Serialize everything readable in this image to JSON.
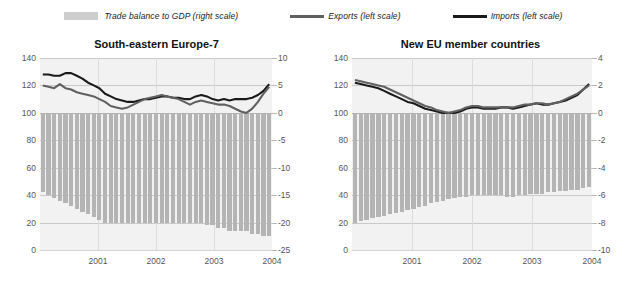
{
  "legend": {
    "items": [
      {
        "label": "Trade balance to GDP (right scale)",
        "marker": "bar-swatch-icon",
        "color": "#cdcdcd"
      },
      {
        "label": "Exports (left scale)",
        "marker": "line-swatch-icon",
        "color": "#606060"
      },
      {
        "label": "Imports (left scale)",
        "marker": "line-swatch-icon",
        "color": "#1a1a1a"
      }
    ]
  },
  "chart_data": [
    {
      "type": "line",
      "panel": "left",
      "title": "South-eastern Europe-7",
      "xlabel": "",
      "ylabel": "",
      "ylim": [
        0,
        140
      ],
      "y2lim": [
        -25,
        10
      ],
      "yticks": [
        0,
        20,
        40,
        60,
        80,
        100,
        120,
        140
      ],
      "y2ticks": [
        -25,
        -20,
        -15,
        -10,
        -5,
        0,
        5,
        10
      ],
      "grid": true,
      "legend_position": "top-center",
      "categories": [
        "2001",
        "2002",
        "2003",
        "2004"
      ],
      "xtick_labels": [
        "2001",
        "2002",
        "2003",
        "2004"
      ],
      "x": [
        0,
        1,
        2,
        3,
        4,
        5,
        6,
        7,
        8,
        9,
        10,
        11,
        12,
        13,
        14,
        15,
        16,
        17,
        18,
        19,
        20,
        21,
        22,
        23,
        24,
        25,
        26,
        27,
        28,
        29,
        30,
        31,
        32,
        33,
        34,
        35,
        36,
        37,
        38,
        39,
        40
      ],
      "series": [
        {
          "name": "Imports (left scale)",
          "axis": "left",
          "color": "#1a1a1a",
          "values": [
            128,
            128,
            127,
            127,
            129,
            129,
            127,
            125,
            122,
            120,
            118,
            114,
            112,
            110,
            109,
            108,
            108,
            109,
            110,
            110,
            111,
            112,
            112,
            111,
            111,
            110,
            110,
            112,
            113,
            112,
            110,
            109,
            110,
            109,
            110,
            110,
            110,
            111,
            113,
            116,
            121
          ]
        },
        {
          "name": "Exports (left scale)",
          "axis": "left",
          "color": "#606060",
          "values": [
            120,
            119,
            118,
            121,
            118,
            117,
            115,
            114,
            113,
            112,
            110,
            108,
            105,
            104,
            103,
            104,
            106,
            108,
            110,
            111,
            112,
            113,
            112,
            111,
            110,
            108,
            106,
            108,
            109,
            108,
            107,
            106,
            106,
            105,
            103,
            101,
            100,
            103,
            108,
            114,
            119
          ]
        },
        {
          "name": "Trade balance to GDP (right scale)",
          "axis": "right",
          "type": "bar",
          "color": "#b4b4b4",
          "values": [
            -14.5,
            -15.0,
            -15.5,
            -16.0,
            -16.5,
            -17.0,
            -17.5,
            -18.0,
            -18.5,
            -19.0,
            -19.5,
            -20.0,
            -20.0,
            -20.0,
            -20.0,
            -20.0,
            -20.0,
            -20.0,
            -20.0,
            -20.0,
            -20.0,
            -20.0,
            -20.0,
            -20.0,
            -20.0,
            -20.0,
            -20.0,
            -20.0,
            -20.0,
            -20.5,
            -20.5,
            -21.0,
            -21.0,
            -21.5,
            -21.5,
            -21.5,
            -21.5,
            -22.0,
            -22.0,
            -22.5,
            -22.5
          ]
        }
      ]
    },
    {
      "type": "line",
      "panel": "right",
      "title": "New EU member countries",
      "xlabel": "",
      "ylabel": "",
      "ylim": [
        0,
        140
      ],
      "y2lim": [
        -10,
        4
      ],
      "yticks": [
        0,
        20,
        40,
        60,
        80,
        100,
        120,
        140
      ],
      "y2ticks": [
        -10,
        -8,
        -6,
        -4,
        -2,
        0,
        2,
        4
      ],
      "grid": true,
      "legend_position": "top-center",
      "categories": [
        "2001",
        "2002",
        "2003",
        "2004"
      ],
      "xtick_labels": [
        "2001",
        "2002",
        "2003",
        "2004"
      ],
      "x": [
        0,
        1,
        2,
        3,
        4,
        5,
        6,
        7,
        8,
        9,
        10,
        11,
        12,
        13,
        14,
        15,
        16,
        17,
        18,
        19,
        20,
        21,
        22,
        23,
        24,
        25,
        26,
        27,
        28,
        29,
        30,
        31,
        32,
        33,
        34,
        35,
        36,
        37,
        38,
        39,
        40
      ],
      "series": [
        {
          "name": "Imports (left scale)",
          "axis": "left",
          "color": "#1a1a1a",
          "values": [
            122,
            121,
            120,
            119,
            118,
            116,
            114,
            112,
            110,
            108,
            107,
            105,
            103,
            102,
            101,
            100,
            100,
            100,
            101,
            103,
            104,
            104,
            103,
            103,
            103,
            104,
            104,
            103,
            104,
            105,
            106,
            107,
            106,
            106,
            107,
            108,
            109,
            111,
            113,
            117,
            121
          ]
        },
        {
          "name": "Exports (left scale)",
          "axis": "left",
          "color": "#606060",
          "values": [
            124,
            123,
            122,
            121,
            120,
            119,
            117,
            115,
            113,
            111,
            109,
            107,
            105,
            104,
            102,
            101,
            100,
            101,
            102,
            104,
            105,
            105,
            104,
            104,
            104,
            104,
            104,
            104,
            105,
            106,
            106,
            107,
            107,
            106,
            107,
            108,
            110,
            112,
            114,
            117,
            120
          ]
        },
        {
          "name": "Trade balance to GDP (right scale)",
          "axis": "right",
          "type": "bar",
          "color": "#b4b4b4",
          "values": [
            -8.0,
            -7.9,
            -7.8,
            -7.7,
            -7.6,
            -7.5,
            -7.4,
            -7.3,
            -7.2,
            -7.1,
            -7.0,
            -6.9,
            -6.8,
            -6.6,
            -6.5,
            -6.4,
            -6.3,
            -6.2,
            -6.1,
            -6.1,
            -6.0,
            -6.0,
            -6.0,
            -6.0,
            -6.0,
            -6.0,
            -6.1,
            -6.1,
            -6.0,
            -6.0,
            -5.9,
            -5.9,
            -5.9,
            -5.8,
            -5.8,
            -5.7,
            -5.7,
            -5.6,
            -5.6,
            -5.5,
            -5.4
          ]
        }
      ]
    }
  ]
}
